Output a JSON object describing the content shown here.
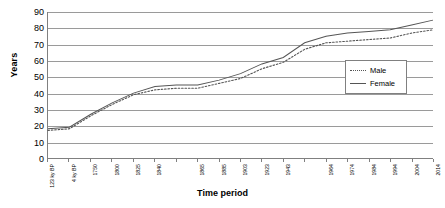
{
  "chart_data": {
    "type": "line",
    "title": "",
    "xlabel": "Time period",
    "ylabel": "Years",
    "ylim": [
      0,
      90
    ],
    "ytick_step": 10,
    "yticks": [
      0,
      10,
      20,
      30,
      40,
      50,
      60,
      70,
      80,
      90
    ],
    "grid": true,
    "legend_position": "right-inside",
    "categories": [
      "123 ky BP",
      "4 ky BP",
      "1750",
      "1800",
      "1825",
      "1840",
      "1850",
      "1865",
      "1885",
      "1903",
      "1923",
      "1943",
      "1954",
      "1964",
      "1974",
      "1984",
      "1994",
      "2004",
      "2014"
    ],
    "xtick_labels_shown": [
      "123 ky BP",
      "4 ky BP",
      "1750",
      "1800",
      "1825",
      "1840",
      "1865",
      "1885",
      "1903",
      "1923",
      "1943",
      "1964",
      "1974",
      "1984",
      "1994",
      "2004",
      "2014"
    ],
    "series": [
      {
        "name": "Male",
        "style": "dotted",
        "color": "#555555",
        "values": [
          17,
          18,
          26,
          33,
          39,
          42,
          43,
          43,
          46,
          49,
          55,
          59,
          67,
          71,
          72,
          73,
          74,
          77,
          79
        ]
      },
      {
        "name": "Female",
        "style": "solid",
        "color": "#555555",
        "values": [
          18,
          19,
          27,
          34,
          40,
          44,
          45,
          45,
          48,
          52,
          58,
          62,
          71,
          75,
          77,
          78,
          79,
          82,
          85
        ]
      }
    ]
  },
  "legend": {
    "items": [
      {
        "label": "Male",
        "key": "dotted-line-key"
      },
      {
        "label": "Female",
        "key": "solid-line-key"
      }
    ]
  },
  "axes": {
    "y_title": "Years",
    "x_title": "Time period"
  }
}
